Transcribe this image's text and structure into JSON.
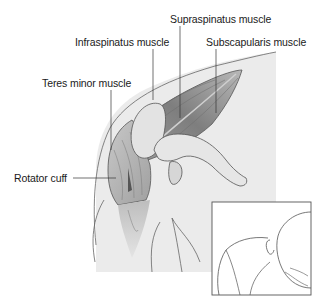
{
  "figure": {
    "labels": [
      {
        "id": "supraspinatus",
        "text": "Supraspinatus muscle"
      },
      {
        "id": "infraspinatus",
        "text": "Infraspinatus muscle"
      },
      {
        "id": "subscapularis",
        "text": "Subscapularis muscle"
      },
      {
        "id": "teres-minor",
        "text": "Teres minor muscle"
      },
      {
        "id": "rotator-cuff",
        "text": "Rotator cuff"
      }
    ],
    "inset": {
      "description": "Orientation view: person bending forward, shoulder highlighted"
    },
    "colors": {
      "background": "#ffffff",
      "skin_region": "#e9e9e9",
      "muscle_dark": "#8a8a8a",
      "muscle_mid": "#b5b5b5",
      "bone_light": "#dcdcdc",
      "outline": "#555555",
      "leader_line": "#333333",
      "text": "#1a1a1a"
    }
  }
}
